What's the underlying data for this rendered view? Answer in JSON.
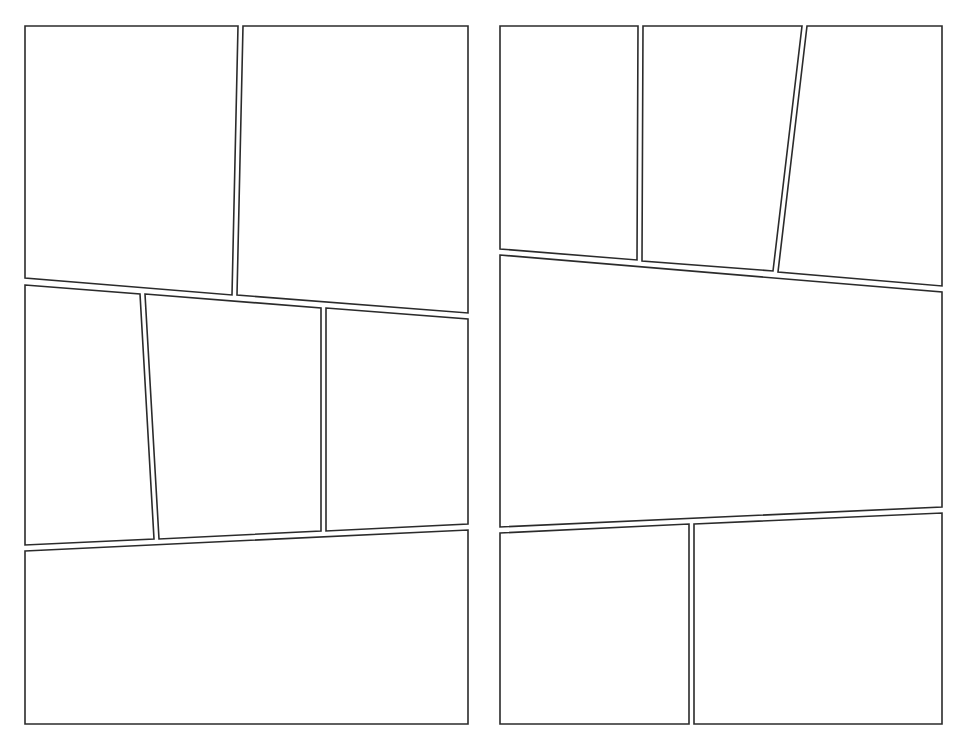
{
  "document": {
    "type": "comic-page-template",
    "page_count": 2,
    "colors": {
      "background": "#ffffff",
      "border": "#2b2b2b"
    }
  },
  "pages": [
    {
      "id": "left-page",
      "panels": [
        {
          "id": "L1",
          "points": [
            [
              25,
              26
            ],
            [
              238,
              26
            ],
            [
              232,
              295
            ],
            [
              25,
              278
            ]
          ]
        },
        {
          "id": "L2",
          "points": [
            [
              243,
              26
            ],
            [
              468,
              26
            ],
            [
              468,
              313
            ],
            [
              237,
              295
            ]
          ]
        },
        {
          "id": "L3",
          "points": [
            [
              25,
              285
            ],
            [
              140,
              294
            ],
            [
              154,
              539
            ],
            [
              25,
              545
            ]
          ]
        },
        {
          "id": "L4",
          "points": [
            [
              145,
              294
            ],
            [
              321,
              308
            ],
            [
              321,
              531
            ],
            [
              159,
              539
            ]
          ]
        },
        {
          "id": "L5",
          "points": [
            [
              326,
              308
            ],
            [
              468,
              319
            ],
            [
              468,
              524
            ],
            [
              326,
              531
            ]
          ]
        },
        {
          "id": "L6",
          "points": [
            [
              25,
              551
            ],
            [
              468,
              530
            ],
            [
              468,
              724
            ],
            [
              25,
              724
            ]
          ]
        }
      ]
    },
    {
      "id": "right-page",
      "panels": [
        {
          "id": "R1",
          "points": [
            [
              500,
              26
            ],
            [
              638,
              26
            ],
            [
              637,
              260
            ],
            [
              500,
              249
            ]
          ]
        },
        {
          "id": "R2",
          "points": [
            [
              643,
              26
            ],
            [
              802,
              26
            ],
            [
              773,
              271
            ],
            [
              642,
              261
            ]
          ]
        },
        {
          "id": "R3",
          "points": [
            [
              807,
              26
            ],
            [
              942,
              26
            ],
            [
              942,
              286
            ],
            [
              778,
              272
            ]
          ]
        },
        {
          "id": "R4",
          "points": [
            [
              500,
              255
            ],
            [
              942,
              292
            ],
            [
              942,
              507
            ],
            [
              500,
              527
            ]
          ]
        },
        {
          "id": "R5",
          "points": [
            [
              500,
              533
            ],
            [
              689,
              524
            ],
            [
              689,
              724
            ],
            [
              500,
              724
            ]
          ]
        },
        {
          "id": "R6",
          "points": [
            [
              694,
              524
            ],
            [
              942,
              513
            ],
            [
              942,
              724
            ],
            [
              694,
              724
            ]
          ]
        }
      ]
    }
  ]
}
